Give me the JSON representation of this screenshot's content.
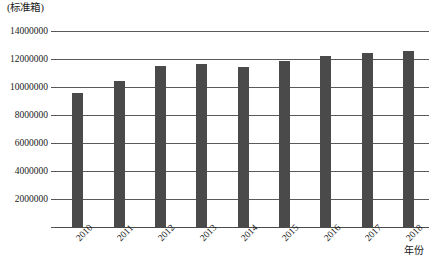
{
  "chart_data": {
    "type": "bar",
    "title": "",
    "subtitle": "",
    "xlabel": "年份",
    "ylabel": "(标准箱)",
    "categories": [
      "2010",
      "2011",
      "2012",
      "2013",
      "2014",
      "2015",
      "2016",
      "2017",
      "2018"
    ],
    "values": [
      9600000,
      10400000,
      11500000,
      11650000,
      11450000,
      11850000,
      12200000,
      12450000,
      12550000
    ],
    "series": [
      {
        "name": "",
        "values": [
          9600000,
          10400000,
          11500000,
          11650000,
          11450000,
          11850000,
          12200000,
          12450000,
          12550000
        ]
      }
    ],
    "ylim": [
      0,
      14000000
    ],
    "xlim": [
      0,
      9
    ],
    "ytick_labels": [
      "14000000",
      "12000000",
      "10000000",
      "8000000",
      "6000000",
      "4000000",
      "2000000",
      ""
    ],
    "ytick_values": [
      14000000,
      12000000,
      10000000,
      8000000,
      6000000,
      4000000,
      2000000,
      0
    ],
    "grid": "horizontal",
    "legend": "none",
    "bar_color": "#4a4a4a",
    "grid_color": "#5a5a5a",
    "axis_color": "#4a4a4a",
    "background": "#ffffff"
  }
}
